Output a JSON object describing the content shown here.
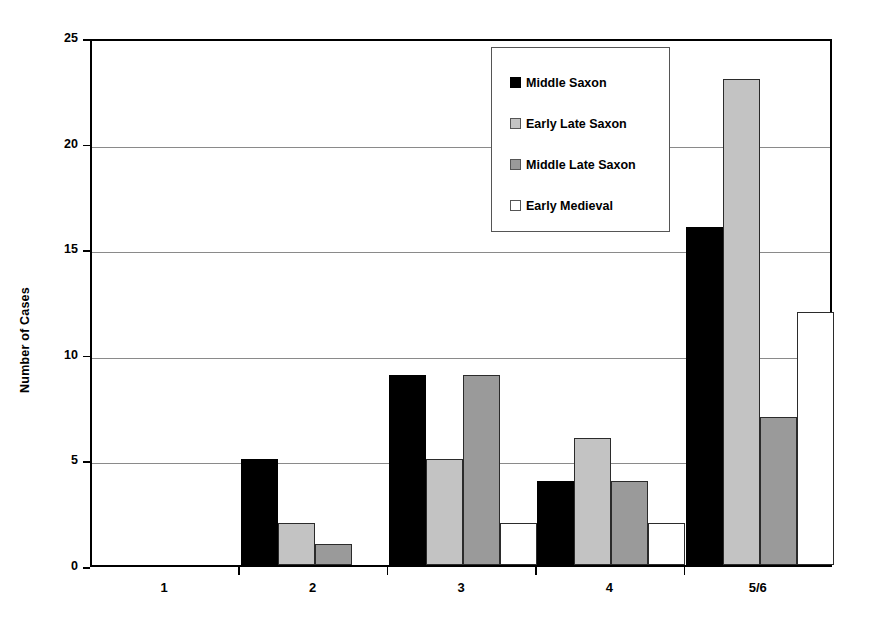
{
  "chart_data": {
    "type": "bar",
    "title": "",
    "xlabel": "",
    "ylabel": "Number of Cases",
    "categories": [
      "1",
      "2",
      "3",
      "4",
      "5/6"
    ],
    "series": [
      {
        "name": "Middle Saxon",
        "color": "#000000",
        "values": [
          0,
          5,
          9,
          4,
          16
        ]
      },
      {
        "name": "Early Late Saxon",
        "color": "#c3c3c3",
        "values": [
          0,
          2,
          5,
          6,
          23
        ]
      },
      {
        "name": "Middle Late Saxon",
        "color": "#9a9a9a",
        "values": [
          0,
          1,
          9,
          4,
          7
        ]
      },
      {
        "name": "Early Medieval",
        "color": "#ffffff",
        "values": [
          0,
          0,
          2,
          2,
          12
        ]
      }
    ],
    "ylim": [
      0,
      25
    ],
    "yticks": [
      0,
      5,
      10,
      15,
      20,
      25
    ],
    "grid": true,
    "legend_position": "upper-center"
  },
  "legend": {
    "items": [
      {
        "label": "Middle Saxon"
      },
      {
        "label": "Early Late Saxon"
      },
      {
        "label": "Middle Late Saxon"
      },
      {
        "label": "Early Medieval"
      }
    ]
  }
}
